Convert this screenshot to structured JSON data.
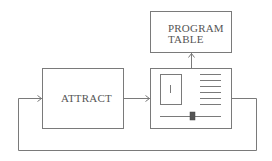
{
  "diagram": {
    "colors": {
      "stroke": "#7a7a7a",
      "text": "#555555",
      "knob": "#555555",
      "background": "#ffffff"
    },
    "nodes": {
      "attract": {
        "label": "ATTRACT"
      },
      "program_table": {
        "line1": "PROGRAM",
        "line2": "TABLE"
      },
      "display_panel": {
        "inner_box_glyph": "I",
        "list_lines": 6,
        "slider": {
          "present": true
        }
      }
    },
    "edges": [
      {
        "from": "attract",
        "to": "display_panel",
        "label": ""
      },
      {
        "from": "display_panel",
        "to": "program_table",
        "label": ""
      },
      {
        "from": "display_panel",
        "to": "attract",
        "label": "",
        "route": "loop-back-below"
      }
    ]
  }
}
